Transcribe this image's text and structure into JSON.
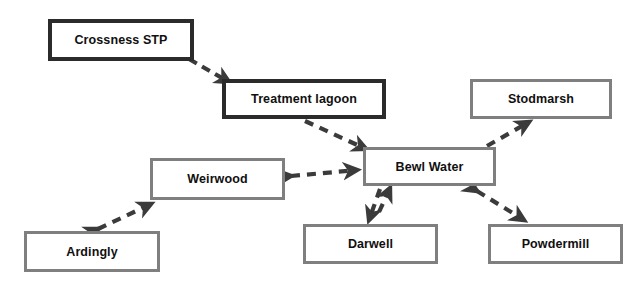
{
  "diagram": {
    "background_color": "#ffffff",
    "dark_border_color": "#2b2b2b",
    "gray_border_color": "#7f7f7f",
    "edge_color": "#3b3b3b",
    "label_color": "#101010",
    "nodes": [
      {
        "id": "crossness-stp",
        "label": "Crossness STP",
        "style": "dark",
        "x": 48,
        "y": 19,
        "width": 146,
        "height": 42,
        "font_size": 12.5
      },
      {
        "id": "treatment-lagoon",
        "label": "Treatment lagoon",
        "style": "dark",
        "x": 222,
        "y": 79,
        "width": 164,
        "height": 40,
        "font_size": 12.5
      },
      {
        "id": "stodmarsh",
        "label": "Stodmarsh",
        "style": "gray",
        "x": 470,
        "y": 79,
        "width": 142,
        "height": 40,
        "font_size": 12.5
      },
      {
        "id": "bewl-water",
        "label": "Bewl Water",
        "style": "gray",
        "x": 363,
        "y": 147,
        "width": 133,
        "height": 39,
        "font_size": 12.5
      },
      {
        "id": "weirwood",
        "label": "Weirwood",
        "style": "gray",
        "x": 150,
        "y": 158,
        "width": 135,
        "height": 42,
        "font_size": 12.5
      },
      {
        "id": "ardingly",
        "label": "Ardingly",
        "style": "gray",
        "x": 24,
        "y": 231,
        "width": 136,
        "height": 41,
        "font_size": 12.5
      },
      {
        "id": "darwell",
        "label": "Darwell",
        "style": "gray",
        "x": 303,
        "y": 224,
        "width": 135,
        "height": 40,
        "font_size": 12.5
      },
      {
        "id": "powdermill",
        "label": "Powdermill",
        "style": "gray",
        "x": 488,
        "y": 224,
        "width": 135,
        "height": 40,
        "font_size": 12.5
      }
    ],
    "edges": [
      {
        "id": "crossness-to-lagoon",
        "from": "crossness-stp",
        "to": "treatment-lagoon",
        "direction": "one-way",
        "x1": 189,
        "y1": 59,
        "x2": 231,
        "y2": 83
      },
      {
        "id": "lagoon-to-bewl",
        "from": "treatment-lagoon",
        "to": "bewl-water",
        "direction": "one-way",
        "x1": 305,
        "y1": 121,
        "x2": 367,
        "y2": 150
      },
      {
        "id": "weirwood-bewl",
        "from": "weirwood",
        "to": "bewl-water",
        "direction": "two-way",
        "x1": 290,
        "y1": 176,
        "x2": 358,
        "y2": 170
      },
      {
        "id": "ardingly-weirwood",
        "from": "ardingly",
        "to": "weirwood",
        "direction": "two-way",
        "x1": 97,
        "y1": 228,
        "x2": 152,
        "y2": 203
      },
      {
        "id": "bewl-darwell",
        "from": "bewl-water",
        "to": "darwell",
        "direction": "two-way-parallel",
        "x1": 380,
        "y1": 190,
        "x2": 371,
        "y2": 221
      },
      {
        "id": "bewl-powdermill",
        "from": "bewl-water",
        "to": "powdermill",
        "direction": "two-way",
        "x1": 476,
        "y1": 191,
        "x2": 525,
        "y2": 221
      },
      {
        "id": "bewl-stodmarsh",
        "from": "bewl-water",
        "to": "stodmarsh",
        "direction": "one-way",
        "x1": 487,
        "y1": 145,
        "x2": 528,
        "y2": 123
      }
    ]
  }
}
